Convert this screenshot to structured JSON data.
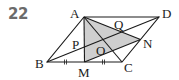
{
  "problem_number": "22",
  "figure": {
    "type": "parallelogram-diagram",
    "shade_color": "#cfcfcf",
    "line_color": "#1a1a1a",
    "points": {
      "A": {
        "label": "A",
        "x": 84,
        "y": 17
      },
      "D": {
        "label": "D",
        "x": 159,
        "y": 17
      },
      "B": {
        "label": "B",
        "x": 47,
        "y": 62
      },
      "C": {
        "label": "C",
        "x": 122,
        "y": 62
      },
      "M": {
        "label": "M",
        "x": 84.5,
        "y": 62
      },
      "N": {
        "label": "N",
        "x": 140.5,
        "y": 39.5
      },
      "O": {
        "label": "O",
        "x": 103,
        "y": 39.5
      },
      "P": {
        "label": "P",
        "x": 84,
        "y": 45
      },
      "Q": {
        "label": "Q",
        "x": 121,
        "y": 30
      }
    },
    "segments": [
      "AD",
      "DC",
      "CB",
      "BA",
      "AC",
      "BD",
      "AM",
      "AN",
      "MN"
    ],
    "shaded_region": [
      "A",
      "M",
      "N"
    ],
    "tick_marks": [
      "BM",
      "MC"
    ]
  }
}
